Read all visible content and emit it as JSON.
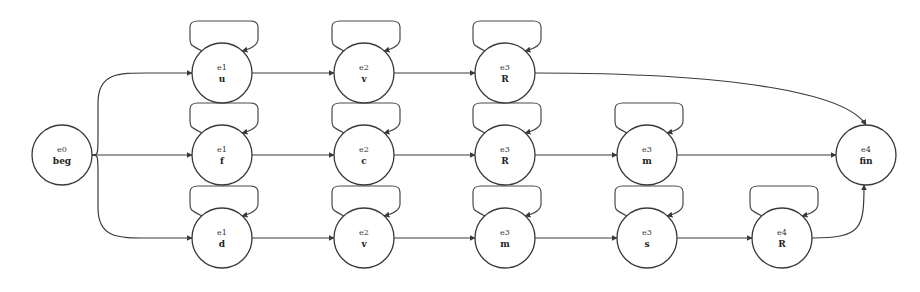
{
  "diagram": {
    "type": "state-transition-graph",
    "colors": {
      "stroke": "#3a3a3a",
      "background": "#ffffff"
    },
    "nodes": [
      {
        "id": "n0",
        "top": "e0",
        "bottom": "beg",
        "x": 62,
        "y": 155,
        "self_loop": false
      },
      {
        "id": "r1a",
        "top": "e1",
        "bottom": "u",
        "x": 222,
        "y": 73,
        "self_loop": true
      },
      {
        "id": "r1b",
        "top": "e2",
        "bottom": "v",
        "x": 364,
        "y": 73,
        "self_loop": true
      },
      {
        "id": "r1c",
        "top": "e3",
        "bottom": "R",
        "x": 505,
        "y": 73,
        "self_loop": true
      },
      {
        "id": "r2a",
        "top": "e1",
        "bottom": "f",
        "x": 222,
        "y": 155,
        "self_loop": true
      },
      {
        "id": "r2b",
        "top": "e2",
        "bottom": "c",
        "x": 364,
        "y": 155,
        "self_loop": true
      },
      {
        "id": "r2c",
        "top": "e3",
        "bottom": "R",
        "x": 505,
        "y": 155,
        "self_loop": true
      },
      {
        "id": "r2d",
        "top": "e3",
        "bottom": "m",
        "x": 647,
        "y": 155,
        "self_loop": true
      },
      {
        "id": "fin",
        "top": "e4",
        "bottom": "fin",
        "x": 866,
        "y": 155,
        "self_loop": false
      },
      {
        "id": "r3a",
        "top": "e1",
        "bottom": "d",
        "x": 222,
        "y": 238,
        "self_loop": true
      },
      {
        "id": "r3b",
        "top": "e2",
        "bottom": "v",
        "x": 364,
        "y": 238,
        "self_loop": true
      },
      {
        "id": "r3c",
        "top": "e3",
        "bottom": "m",
        "x": 505,
        "y": 238,
        "self_loop": true
      },
      {
        "id": "r3d",
        "top": "e3",
        "bottom": "s",
        "x": 647,
        "y": 238,
        "self_loop": true
      },
      {
        "id": "r3e",
        "top": "e4",
        "bottom": "R",
        "x": 782,
        "y": 238,
        "self_loop": true
      }
    ],
    "edges": [
      {
        "from": "n0",
        "to": "r1a"
      },
      {
        "from": "n0",
        "to": "r2a"
      },
      {
        "from": "n0",
        "to": "r3a"
      },
      {
        "from": "r1a",
        "to": "r1b"
      },
      {
        "from": "r1b",
        "to": "r1c"
      },
      {
        "from": "r1c",
        "to": "fin"
      },
      {
        "from": "r2a",
        "to": "r2b"
      },
      {
        "from": "r2b",
        "to": "r2c"
      },
      {
        "from": "r2c",
        "to": "r2d"
      },
      {
        "from": "r2d",
        "to": "fin"
      },
      {
        "from": "r3a",
        "to": "r3b"
      },
      {
        "from": "r3b",
        "to": "r3c"
      },
      {
        "from": "r3c",
        "to": "r3d"
      },
      {
        "from": "r3d",
        "to": "r3e"
      },
      {
        "from": "r3e",
        "to": "fin"
      }
    ]
  }
}
